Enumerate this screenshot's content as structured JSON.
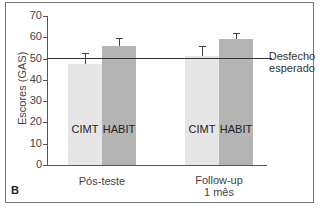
{
  "chart_data": {
    "type": "bar",
    "title": "",
    "panel_label": "B",
    "xlabel": "",
    "ylabel": "Escores (GAS)",
    "ylim": [
      0,
      70
    ],
    "yticks": [
      0,
      10,
      20,
      30,
      40,
      50,
      60,
      70
    ],
    "grid": false,
    "categories": [
      "Pós-teste",
      "Follow-up\n1 mês"
    ],
    "series": [
      {
        "name": "CIMT",
        "values": [
          47.5,
          51
        ],
        "error_upper": [
          52.5,
          56
        ],
        "color": "#e6e6e6"
      },
      {
        "name": "HABIT",
        "values": [
          56,
          59
        ],
        "error_upper": [
          59.5,
          62
        ],
        "color": "#b4b4b4"
      }
    ],
    "reference_line": {
      "value": 50,
      "label": "Desfecho\nesperado"
    },
    "legend": "inline bar labels"
  }
}
